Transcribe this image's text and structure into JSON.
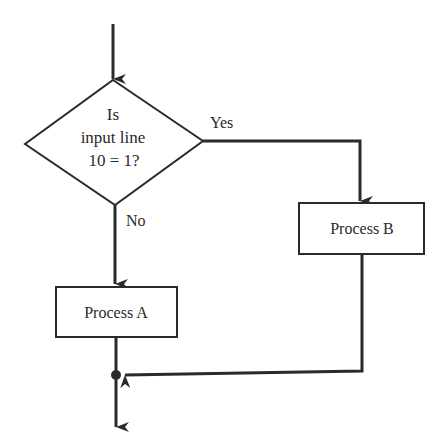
{
  "flowchart": {
    "decision": {
      "line1": "Is",
      "line2": "input line",
      "line3": "10 = 1?"
    },
    "branches": {
      "yes_label": "Yes",
      "no_label": "No"
    },
    "process_a": {
      "label": "Process A"
    },
    "process_b": {
      "label": "Process B"
    }
  },
  "colors": {
    "stroke": "#2a2a2a",
    "background": "#ffffff"
  }
}
